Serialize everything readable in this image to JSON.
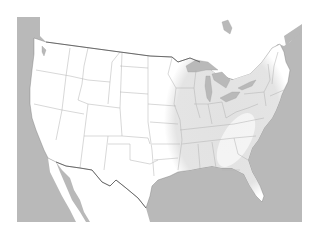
{
  "map": {
    "subject": "United States",
    "highlighted_region": "Eastern United States",
    "colors": {
      "background": "#ffffff",
      "water": "#b9b9b9",
      "land": "#ffffff",
      "highlight": "#e4e4e4",
      "state_border": "#a8a8a8",
      "country_border": "#555555"
    }
  }
}
